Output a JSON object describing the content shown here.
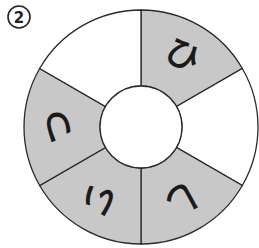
{
  "problem_number": "2",
  "colors": {
    "shaded": "#c8c8c8",
    "blank": "#ffffff",
    "stroke": "#2a2a2a"
  },
  "wheel": {
    "center": [
      141,
      127
    ],
    "outer_radius": 117,
    "inner_radius": 41,
    "sectors": [
      {
        "position": "top-right",
        "shaded": true,
        "char": "ひ"
      },
      {
        "position": "right",
        "shaded": false,
        "char": ""
      },
      {
        "position": "bottom-right",
        "shaded": true,
        "char": "し"
      },
      {
        "position": "bottom-left",
        "shaded": true,
        "char": "い"
      },
      {
        "position": "left",
        "shaded": true,
        "char": "つ"
      },
      {
        "position": "top-left",
        "shaded": false,
        "char": ""
      }
    ]
  }
}
